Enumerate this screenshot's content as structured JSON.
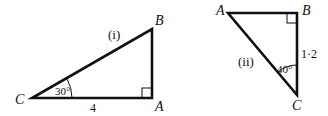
{
  "triangle_i": {
    "label": "(i)",
    "vertices": {
      "C": "C",
      "A": "A",
      "B": "B"
    },
    "angle_C": "30°",
    "side_CA": "4",
    "right_angle_at": "A"
  },
  "triangle_ii": {
    "label": "(ii)",
    "vertices": {
      "A": "A",
      "B": "B",
      "C": "C"
    },
    "angle_C": "40°",
    "side_BC": "1·2",
    "right_angle_at": "B"
  }
}
